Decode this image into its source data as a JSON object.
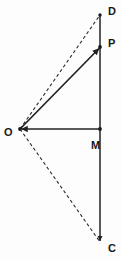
{
  "figure": {
    "background_color": "#fdfdfd",
    "stroke_color": "#222222",
    "label_color": "#171717",
    "width": 122,
    "height": 260
  },
  "points": [
    {
      "id": "D",
      "label": "D",
      "x": 100,
      "y": 15,
      "label_x": 108,
      "label_y": 12,
      "marker": false
    },
    {
      "id": "P",
      "label": "P",
      "x": 100,
      "y": 47,
      "label_x": 108,
      "label_y": 44,
      "marker": true
    },
    {
      "id": "O",
      "label": "O",
      "x": 20,
      "y": 129,
      "label_x": 4,
      "label_y": 133,
      "marker": true
    },
    {
      "id": "M",
      "label": "M",
      "x": 100,
      "y": 129,
      "label_x": 91,
      "label_y": 146,
      "marker": true
    },
    {
      "id": "C",
      "label": "C",
      "x": 100,
      "y": 242,
      "label_x": 108,
      "label_y": 249,
      "marker": false
    }
  ],
  "segments": [
    {
      "id": "DC",
      "name": "vertical-line-d-to-c",
      "from": "D",
      "to": "C",
      "style": "solid",
      "arrow_end": true,
      "arrow_start": false
    },
    {
      "id": "MO",
      "name": "horizontal-line-m-to-o",
      "from": "M",
      "to": "O",
      "style": "solid",
      "arrow_end": true,
      "arrow_start": false
    },
    {
      "id": "OP",
      "name": "vector-o-to-p",
      "from": "O",
      "to": "P",
      "style": "solid",
      "arrow_end": true,
      "arrow_start": false
    },
    {
      "id": "OD",
      "name": "dashed-line-o-to-d",
      "from": "O",
      "to": "D",
      "style": "dashed",
      "arrow_end": false,
      "arrow_start": false
    },
    {
      "id": "OC",
      "name": "dashed-line-o-to-c",
      "from": "O",
      "to": "C",
      "style": "dashed",
      "arrow_end": false,
      "arrow_start": false
    }
  ],
  "labels": {
    "D": "D",
    "P": "P",
    "O": "O",
    "M": "M",
    "C": "C"
  }
}
